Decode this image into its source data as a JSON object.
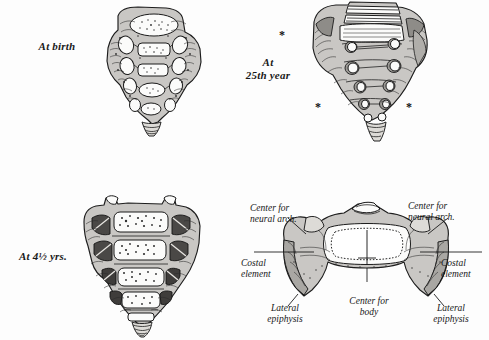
{
  "plate": {
    "title": "Ossification of the sacrum at four stages",
    "background_color": "#fdfdfd",
    "ink_color": "#1a1a1a",
    "bone_fill_color": "#c9c7c4",
    "cartilage_fill_color": "#fbfbfa"
  },
  "figures": [
    {
      "id": "at-birth",
      "label": "At birth",
      "position": "top-left",
      "marker_count": 0
    },
    {
      "id": "at-25th-year",
      "label": "At\n25th year",
      "position": "top-right",
      "marker_count": 3,
      "marker_glyph": "*"
    },
    {
      "id": "at-4-and-half-yrs",
      "label": "At 4½ yrs.",
      "position": "bottom-left",
      "marker_count": 0
    },
    {
      "id": "segment-cross-section",
      "label": "",
      "position": "bottom-right",
      "marker_count": 0
    }
  ],
  "annotations": [
    {
      "id": "center-neural-arch-left",
      "text": "Center for\nneural arch.",
      "align": "left"
    },
    {
      "id": "center-neural-arch-right",
      "text": "Center for\nneural arch.",
      "align": "right"
    },
    {
      "id": "costal-element-left",
      "text": "Costal\nelement",
      "align": "left"
    },
    {
      "id": "costal-element-right",
      "text": "Costal\nelement",
      "align": "right"
    },
    {
      "id": "lateral-epiphysis-left",
      "text": "Lateral\nepiphysis",
      "align": "center"
    },
    {
      "id": "lateral-epiphysis-right",
      "text": "Lateral\nepiphysis",
      "align": "center"
    },
    {
      "id": "center-for-body",
      "text": "Center for\nbody",
      "align": "center"
    }
  ],
  "markers": {
    "asterisk": "*"
  }
}
